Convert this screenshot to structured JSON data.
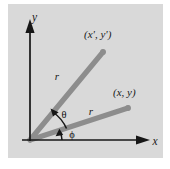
{
  "figure": {
    "panel_bg_color": "#d9d9d9",
    "page_bg_color": "#ffffff",
    "axis_color": "#161616",
    "ray_color": "#8c8c8c",
    "label_color": "#1a1a1a"
  },
  "axes": {
    "x_label": "x",
    "y_label": "y",
    "origin": {
      "x": 30,
      "y": 140
    }
  },
  "rays": [
    {
      "name": "rotated-ray",
      "endpoint_label": "(x', y')",
      "length_label": "r",
      "start": {
        "x": 30,
        "y": 140
      },
      "end": {
        "x": 103,
        "y": 52
      }
    },
    {
      "name": "original-ray",
      "endpoint_label": "(x, y)",
      "length_label": "r",
      "start": {
        "x": 30,
        "y": 140
      },
      "end": {
        "x": 128,
        "y": 108
      }
    }
  ],
  "angles": [
    {
      "name": "theta",
      "label": "θ",
      "description": "angle between original ray and rotated ray"
    },
    {
      "name": "phi",
      "label": "ϕ",
      "description": "angle between x-axis and original ray"
    }
  ]
}
